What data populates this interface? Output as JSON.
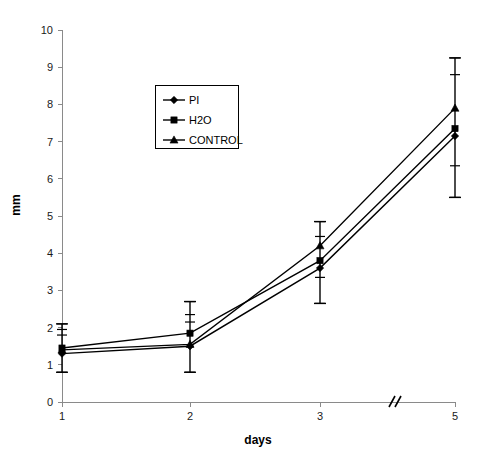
{
  "chart_data": {
    "type": "line",
    "title": "",
    "xlabel": "days",
    "ylabel": "mm",
    "x": [
      1,
      2,
      3,
      5
    ],
    "categories": [
      "1",
      "2",
      "3",
      "5"
    ],
    "xtick_labels": [
      "1",
      "2",
      "3",
      "5"
    ],
    "ytick_labels": [
      "0",
      "1",
      "2",
      "3",
      "4",
      "5",
      "6",
      "7",
      "8",
      "9",
      "10"
    ],
    "ylim": [
      0,
      10
    ],
    "ytick_step": 1,
    "grid": false,
    "legend_position": "upper-left-inside",
    "axis_break": {
      "present": true,
      "symbol": "//",
      "between": [
        "3",
        "5"
      ]
    },
    "series": [
      {
        "name": "PI",
        "marker": "diamond",
        "color": "#000000",
        "values": [
          1.3,
          1.5,
          3.6,
          7.15
        ],
        "err_low": [
          0.8,
          0.8,
          2.65,
          5.5
        ],
        "err_high": [
          2.1,
          2.7,
          4.85,
          9.25
        ]
      },
      {
        "name": "H2O",
        "marker": "square",
        "color": "#000000",
        "values": [
          1.45,
          1.85,
          3.8,
          7.35
        ],
        "err_low": [
          0.8,
          0.8,
          2.65,
          5.5
        ],
        "err_high": [
          2.1,
          2.7,
          4.85,
          9.25
        ]
      },
      {
        "name": "CONTROL",
        "marker": "triangle",
        "color": "#000000",
        "values": [
          1.4,
          1.55,
          4.2,
          7.9
        ],
        "err_low": [
          0.8,
          0.8,
          2.65,
          5.5
        ],
        "err_high": [
          2.1,
          2.7,
          4.85,
          9.25
        ]
      }
    ],
    "error_bar_ticks": {
      "1": [
        2.1,
        1.95,
        1.8,
        0.8
      ],
      "2": [
        2.7,
        2.35,
        2.15,
        0.8
      ],
      "3": [
        4.85,
        4.45,
        3.35,
        2.65
      ],
      "5": [
        9.25,
        8.8,
        6.35,
        5.5
      ]
    }
  },
  "legend": {
    "entries": [
      {
        "label": "PI"
      },
      {
        "label": "H2O"
      },
      {
        "label": "CONTROL"
      }
    ]
  },
  "axes": {
    "y_title": "mm",
    "x_title": "days"
  }
}
